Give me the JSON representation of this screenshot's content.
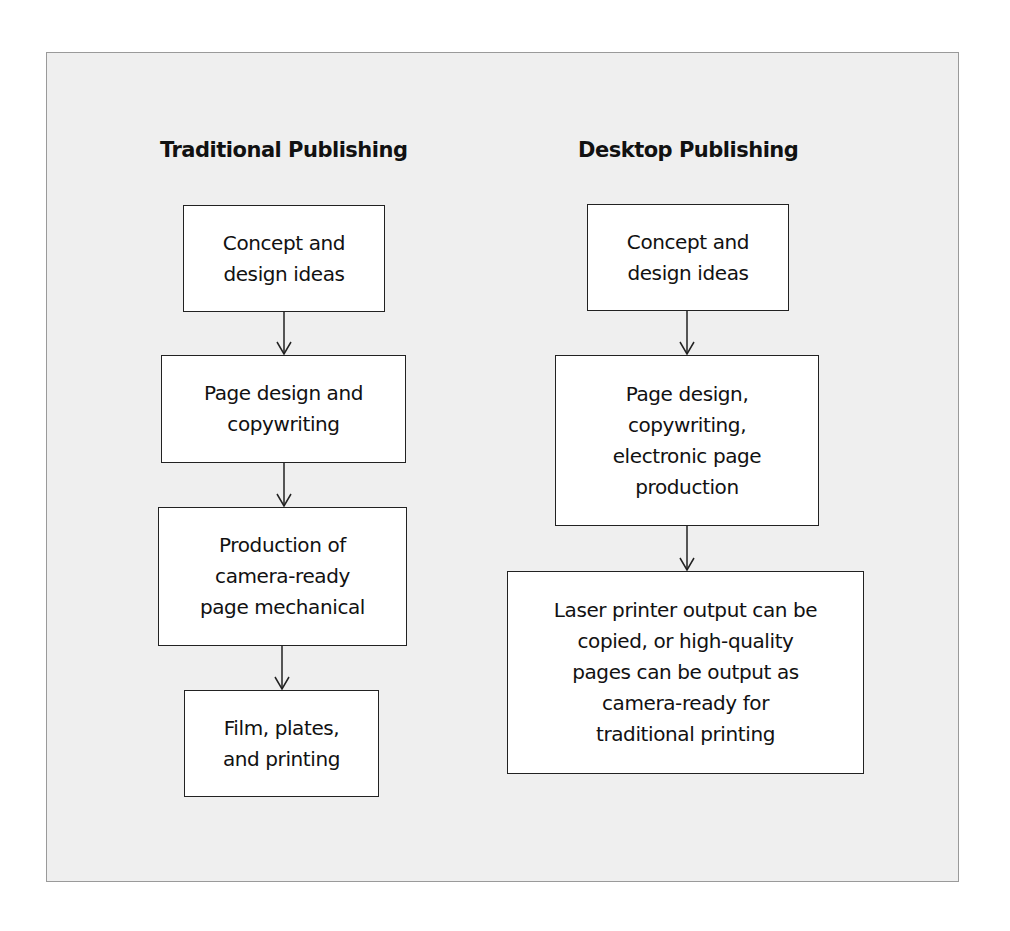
{
  "diagram": {
    "columns": [
      {
        "title": "Traditional Publishing",
        "steps": [
          "Concept and\ndesign ideas",
          "Page design and\ncopywriting",
          "Production of\ncamera-ready\npage mechanical",
          "Film, plates,\nand printing"
        ]
      },
      {
        "title": "Desktop Publishing",
        "steps": [
          "Concept and\ndesign ideas",
          "Page design,\ncopywriting,\nelectronic page\nproduction",
          "Laser printer output can be\ncopied, or high-quality\npages can be output as\ncamera-ready for\ntraditional printing"
        ]
      }
    ],
    "colors": {
      "panel_background": "#efefef",
      "panel_border": "#9a9a9a",
      "box_background": "#ffffff",
      "line": "#222222"
    }
  }
}
